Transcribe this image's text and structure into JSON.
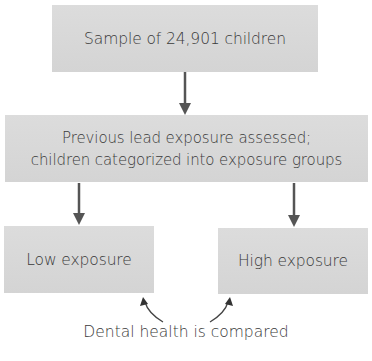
{
  "diagram": {
    "type": "flowchart",
    "nodes": [
      {
        "id": "sample",
        "label": "Sample of 24,901 children"
      },
      {
        "id": "assess",
        "lines": [
          "Previous lead exposure assessed;",
          "children categorized into exposure groups"
        ]
      },
      {
        "id": "low",
        "label": "Low exposure"
      },
      {
        "id": "high",
        "label": "High exposure"
      }
    ],
    "edges": [
      {
        "from": "sample",
        "to": "assess"
      },
      {
        "from": "assess",
        "to": "low"
      },
      {
        "from": "assess",
        "to": "high"
      }
    ],
    "comparison": {
      "label": "Dental health is compared",
      "targets": [
        "low",
        "high"
      ]
    },
    "colors": {
      "box_fill": "#d9d9d9",
      "arrow": "#555555",
      "text": "#3a3a3a",
      "background": "#ffffff"
    }
  }
}
